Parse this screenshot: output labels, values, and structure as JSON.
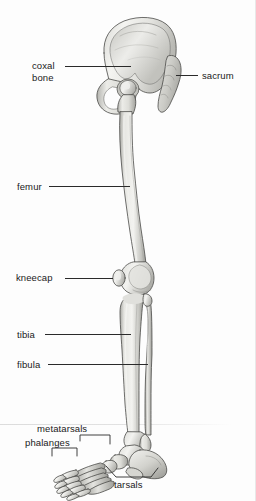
{
  "figure": {
    "background_color": "#fdfdfd",
    "ink_color": "#2a2a2a",
    "bone_fill_light": "#f2f2f0",
    "bone_fill_mid": "#cfcfcc",
    "bone_fill_dark": "#9a9a96",
    "outline_color": "#4a4a48"
  },
  "labels": {
    "coxal_bone": "coxal\nbone",
    "coxal_bone_line1": "coxal",
    "coxal_bone_line2": "bone",
    "sacrum": "sacrum",
    "femur": "femur",
    "kneecap": "kneecap",
    "tibia": "tibia",
    "fibula": "fibula",
    "metatarsals": "metatarsals",
    "phalanges": "phalanges",
    "tarsals": "tarsals"
  },
  "bone_parts": [
    {
      "name": "coxal bone",
      "region": "pelvis"
    },
    {
      "name": "sacrum",
      "region": "pelvis"
    },
    {
      "name": "femur",
      "region": "thigh"
    },
    {
      "name": "kneecap",
      "region": "knee"
    },
    {
      "name": "tibia",
      "region": "leg"
    },
    {
      "name": "fibula",
      "region": "leg"
    },
    {
      "name": "tarsals",
      "region": "foot"
    },
    {
      "name": "metatarsals",
      "region": "foot"
    },
    {
      "name": "phalanges",
      "region": "foot"
    }
  ]
}
